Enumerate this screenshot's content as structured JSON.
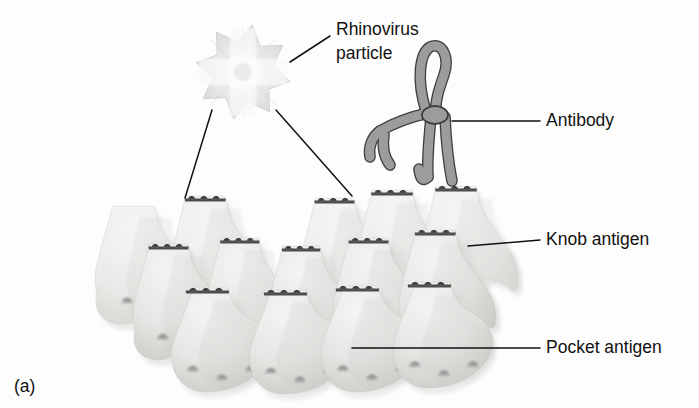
{
  "figure": {
    "caption": "(a)",
    "background_color": "#fdfdfd"
  },
  "labels": {
    "virus": {
      "line1": "Rhinovirus",
      "line2": "particle"
    },
    "antibody": "Antibody",
    "knob": "Knob antigen",
    "pocket": "Pocket antigen"
  },
  "colors": {
    "receptor_fill": "#e4e5e2",
    "receptor_fill_light": "#eef0ee",
    "receptor_shade": "#c8cac6",
    "receptor_dark": "#b3b6b1",
    "knob_dark": "#3a3a3a",
    "pocket_dark": "#6e7270",
    "antibody_fill": "#9b9c9b",
    "antibody_stroke": "#3d3f3e",
    "virus_fill": "#dcdddb",
    "virus_core": "#f4f4f3",
    "leader": "#111111",
    "text": "#111111"
  },
  "virus": {
    "name": "rhinovirus-particle",
    "center_x": 243,
    "center_y": 72,
    "outer_radius": 48,
    "inner_radius": 31,
    "points": 8
  },
  "antibody": {
    "name": "antibody-molecule",
    "center_x": 432,
    "center_y": 115
  },
  "receptors": {
    "rows": 3,
    "knobs_per_cluster": 3,
    "back_row": [
      {
        "x": 96,
        "y": 206,
        "w": 104,
        "h": 118,
        "knob": false
      },
      {
        "x": 170,
        "y": 196,
        "w": 98,
        "h": 124,
        "knob": true
      },
      {
        "x": 300,
        "y": 198,
        "w": 96,
        "h": 122,
        "knob": true
      },
      {
        "x": 356,
        "y": 190,
        "w": 100,
        "h": 128,
        "knob": true
      },
      {
        "x": 420,
        "y": 186,
        "w": 100,
        "h": 130,
        "knob": true
      }
    ],
    "mid_row": [
      {
        "x": 134,
        "y": 244,
        "w": 96,
        "h": 116,
        "knob": true
      },
      {
        "x": 206,
        "y": 238,
        "w": 94,
        "h": 118,
        "knob": true
      },
      {
        "x": 268,
        "y": 246,
        "w": 92,
        "h": 114,
        "knob": true
      },
      {
        "x": 334,
        "y": 238,
        "w": 96,
        "h": 118,
        "knob": true
      },
      {
        "x": 400,
        "y": 230,
        "w": 98,
        "h": 122,
        "knob": true
      }
    ],
    "front_row": [
      {
        "x": 170,
        "y": 288,
        "w": 104,
        "h": 104,
        "knob": true
      },
      {
        "x": 248,
        "y": 290,
        "w": 104,
        "h": 104,
        "knob": true
      },
      {
        "x": 320,
        "y": 286,
        "w": 104,
        "h": 106,
        "knob": true
      },
      {
        "x": 392,
        "y": 282,
        "w": 104,
        "h": 106,
        "knob": true
      }
    ]
  },
  "leaders": {
    "virus_to_knob_left": {
      "x1": 212,
      "y1": 110,
      "x2": 185,
      "y2": 198
    },
    "virus_to_knob_right": {
      "x1": 276,
      "y1": 110,
      "x2": 352,
      "y2": 196
    },
    "virus_label": {
      "x1": 290,
      "y1": 62,
      "x2": 330,
      "y2": 36
    },
    "antibody_label": {
      "x1": 452,
      "y1": 121,
      "x2": 540,
      "y2": 121
    },
    "knob_label": {
      "x1": 468,
      "y1": 246,
      "x2": 540,
      "y2": 240
    },
    "pocket_label": {
      "x1": 352,
      "y1": 348,
      "x2": 540,
      "y2": 348
    }
  },
  "label_positions": {
    "virus_line1": {
      "x": 336,
      "y": 30
    },
    "virus_line2": {
      "x": 336,
      "y": 54
    },
    "antibody": {
      "x": 546,
      "y": 121
    },
    "knob": {
      "x": 546,
      "y": 240
    },
    "pocket": {
      "x": 546,
      "y": 348
    },
    "caption": {
      "x": 14,
      "y": 392
    }
  }
}
